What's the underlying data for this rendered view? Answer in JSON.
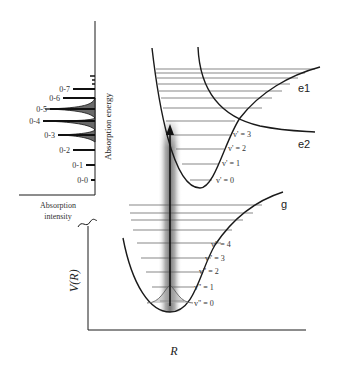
{
  "spectrum": {
    "axis_label": "Absorption energy",
    "intensity_label_line1": "Absorption",
    "intensity_label_line2": "intensity",
    "transitions": [
      {
        "label": "0-7",
        "y": 89,
        "len": 22
      },
      {
        "label": "0-6",
        "y": 98,
        "len": 32
      },
      {
        "label": "0-5",
        "y": 109,
        "len": 45
      },
      {
        "label": "0-4",
        "y": 121,
        "len": 52
      },
      {
        "label": "0-3",
        "y": 135,
        "len": 37
      },
      {
        "label": "0-2",
        "y": 150,
        "len": 22
      },
      {
        "label": "0-1",
        "y": 165,
        "len": 9
      },
      {
        "label": "0-0",
        "y": 180,
        "len": 4
      }
    ]
  },
  "main_axes": {
    "x_label": "R",
    "y_label": "V(R)"
  },
  "curves": {
    "excited_bound": {
      "label": "e1",
      "levels": [
        "v' = 3",
        "v' = 2",
        "v' = 1",
        "v' = 0"
      ]
    },
    "excited_repulsive": {
      "label": "e2"
    },
    "ground": {
      "label": "g",
      "levels": [
        "v\" = 4",
        "v\" = 3",
        "v\" = 2",
        "v\" = 1",
        "v\" = 0"
      ]
    }
  },
  "colors": {
    "line": "#1a1a1a",
    "level": "#555555",
    "band": "#888888",
    "peak_fill": "#6a6a6a"
  }
}
